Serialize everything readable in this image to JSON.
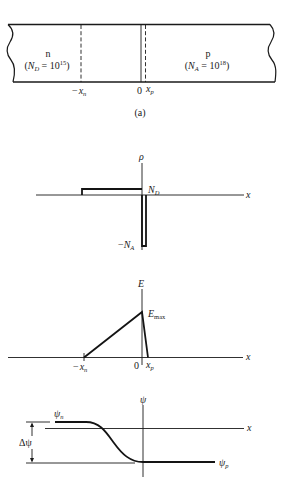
{
  "figure": {
    "panel_a": {
      "caption": "(a)",
      "n_region": {
        "type_label": "n",
        "doping_open": "(",
        "doping_symbol": "N",
        "doping_sub": "D",
        "doping_eq": " = 10",
        "doping_exp": "15",
        "doping_close": ")"
      },
      "p_region": {
        "type_label": "p",
        "doping_open": "(",
        "doping_symbol": "N",
        "doping_sub": "A",
        "doping_eq": " = 10",
        "doping_exp": "18",
        "doping_close": ")"
      },
      "markers": {
        "neg_xn_minus": "−",
        "xn_symbol": "x",
        "xn_sub": "n",
        "zero": "0",
        "xp_symbol": "x",
        "xp_sub": "p"
      }
    },
    "rho_plot": {
      "y_label": "ρ",
      "x_label": "x",
      "pos_level_label": "N",
      "pos_level_sub": "D",
      "neg_level_minus": "−",
      "neg_level_label": "N",
      "neg_level_sub": "A"
    },
    "e_plot": {
      "y_label": "E",
      "x_label": "x",
      "peak_label": "E",
      "peak_sub": "max",
      "tick_neg_minus": "−",
      "tick_neg_symbol": "x",
      "tick_neg_sub": "n",
      "tick_zero": "0",
      "tick_pos_symbol": "x",
      "tick_pos_sub": "p"
    },
    "psi_plot": {
      "y_label": "ψ",
      "x_label": "x",
      "n_level_label": "ψ",
      "n_level_sub": "n",
      "p_level_label": "ψ",
      "p_level_sub": "p",
      "delta_label": "Δψ"
    }
  },
  "colors": {
    "ink": "#1a1a1a",
    "background": "#ffffff"
  }
}
